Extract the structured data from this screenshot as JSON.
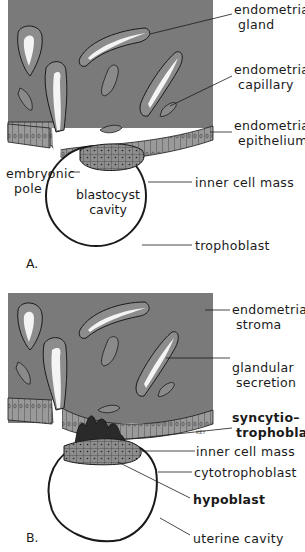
{
  "colors": {
    "stroma": "#7a7a7a",
    "gland_wall": "#8c8c8c",
    "gland_lumen": "#f4f4f4",
    "epithelium": "#9a9a9a",
    "inner_cell_mass": "#8d8d8d",
    "syncytiotrophoblast": "#2a2a2a",
    "outline": "#1a1a1a",
    "background": "#ffffff"
  },
  "panel_a": {
    "letter": "A.",
    "cavity_label_line1": "blastocyst",
    "cavity_label_line2": "cavity",
    "labels": [
      {
        "line1": "endometrial",
        "line2": "gland"
      },
      {
        "line1": "endometrial",
        "line2": "capillary"
      },
      {
        "line1": "endometrial",
        "line2": "epithelium"
      },
      {
        "line1": "embryonic",
        "line2": "pole"
      },
      {
        "line1": "inner cell mass"
      },
      {
        "line1": "trophoblast"
      }
    ]
  },
  "panel_b": {
    "letter": "B.",
    "artist_initials": "KEY",
    "labels": [
      {
        "line1": "endometrial",
        "line2": "stroma"
      },
      {
        "line1": "glandular",
        "line2": "secretion"
      },
      {
        "line1": "syncytio–",
        "line2": "trophoblast"
      },
      {
        "line1": "inner cell mass"
      },
      {
        "line1": "cytotrophoblast"
      },
      {
        "line1": "hypoblast"
      },
      {
        "line1": "uterine cavity"
      }
    ]
  }
}
